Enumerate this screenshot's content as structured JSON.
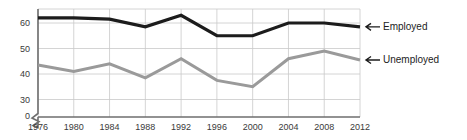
{
  "chart_data": {
    "type": "line",
    "title": "",
    "subtitle": "",
    "xlabel": "",
    "ylabel": "",
    "categories": [
      "1976",
      "1980",
      "1984",
      "1988",
      "1992",
      "1996",
      "2000",
      "2004",
      "2008",
      "2012"
    ],
    "x": [
      1976,
      1980,
      1984,
      1988,
      1992,
      1996,
      2000,
      2004,
      2008,
      2012
    ],
    "series": [
      {
        "name": "Employed",
        "color": "#1c1c1c",
        "values": [
          62,
          62,
          61.5,
          58.5,
          63,
          55,
          55,
          60,
          60,
          58.5
        ]
      },
      {
        "name": "Unemployed",
        "color": "#9a9a9a",
        "values": [
          43.5,
          41,
          44,
          38.5,
          46,
          37.5,
          35,
          46,
          49,
          45.5
        ]
      }
    ],
    "yticks": [
      0,
      30,
      40,
      50,
      60
    ],
    "ylim": [
      0,
      66
    ],
    "xlim": [
      1976,
      2012
    ],
    "y_axis_break": true,
    "y_axis_break_between": [
      0,
      30
    ],
    "grid": true,
    "grid_axes": "both",
    "legend_position": "right-inline-arrows",
    "annotations": [
      {
        "label": "Employed",
        "marker": "left-arrow",
        "series": "Employed"
      },
      {
        "label": "Unemployed",
        "marker": "left-arrow",
        "series": "Unemployed"
      }
    ]
  },
  "axes": {
    "y_tick_labels": [
      "60",
      "50",
      "40",
      "30",
      "0"
    ],
    "x_tick_labels": [
      "1976",
      "1980",
      "1984",
      "1988",
      "1992",
      "1996",
      "2000",
      "2004",
      "2008",
      "2012"
    ]
  },
  "legend": {
    "employed_label": "Employed",
    "unemployed_label": "Unemployed"
  },
  "colors": {
    "employed": "#1c1c1c",
    "unemployed": "#9a9a9a",
    "grid": "#c9c9c9",
    "axis": "#6e6e6e",
    "background": "#ffffff",
    "tick_text": "#3a3a3a"
  }
}
